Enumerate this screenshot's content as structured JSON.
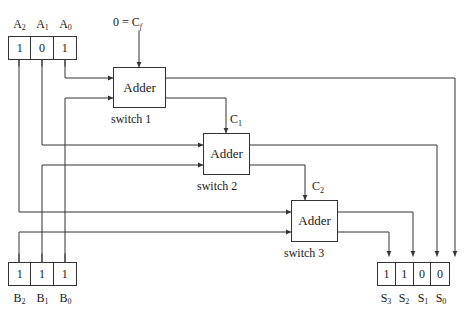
{
  "diagram": {
    "colors": {
      "line": "#333333",
      "text": "#1a1a1a",
      "background": "#ffffff"
    },
    "carry_in": {
      "label_value": "0",
      "label_equals": "=",
      "label_name": "C",
      "label_sub": "f",
      "full": "0 = Cf"
    },
    "input_a": {
      "name": "A",
      "bits": [
        "1",
        "0",
        "1"
      ],
      "labels": [
        "A2",
        "A1",
        "A0"
      ],
      "label_base": [
        "A",
        "A",
        "A"
      ],
      "label_subs": [
        "2",
        "1",
        "0"
      ]
    },
    "input_b": {
      "name": "B",
      "bits": [
        "1",
        "1",
        "1"
      ],
      "labels": [
        "B2",
        "B1",
        "B0"
      ],
      "label_base": [
        "B",
        "B",
        "B"
      ],
      "label_subs": [
        "2",
        "1",
        "0"
      ]
    },
    "output_s": {
      "name": "S",
      "bits": [
        "1",
        "1",
        "0",
        "0"
      ],
      "labels": [
        "S3",
        "S2",
        "S1",
        "S0"
      ],
      "label_base": [
        "S",
        "S",
        "S",
        "S"
      ],
      "label_subs": [
        "3",
        "2",
        "1",
        "0"
      ]
    },
    "adders": [
      {
        "box_label": "Adder",
        "caption": "switch 1"
      },
      {
        "box_label": "Adder",
        "caption": "switch 2"
      },
      {
        "box_label": "Adder",
        "caption": "switch 3"
      }
    ],
    "carries": [
      {
        "base": "C",
        "sub": "1",
        "full": "C1"
      },
      {
        "base": "C",
        "sub": "2",
        "full": "C2"
      }
    ]
  }
}
